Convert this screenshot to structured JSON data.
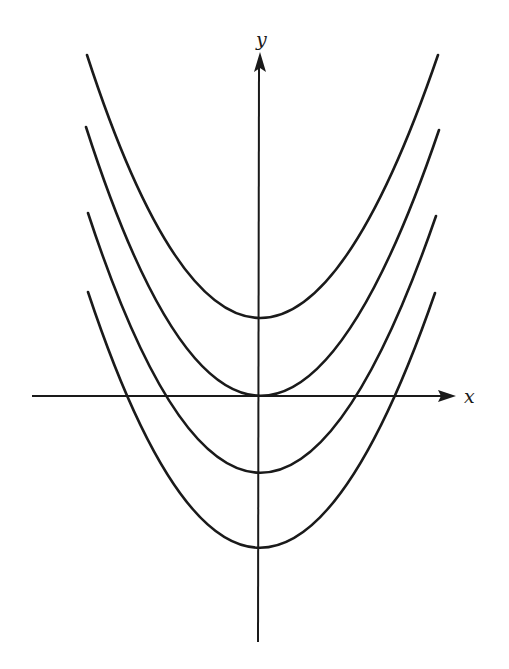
{
  "figure": {
    "axes": {
      "x_label": "x",
      "y_label": "y"
    },
    "curves": [
      {
        "name": "parabola-shift-up",
        "vertex_px": [
          258,
          318
        ],
        "left_end_px": [
          87,
          55
        ],
        "right_end_px": [
          438,
          55
        ]
      },
      {
        "name": "parabola-through-origin",
        "vertex_px": [
          258,
          396
        ],
        "left_end_px": [
          86,
          127
        ],
        "right_end_px": [
          439,
          130
        ]
      },
      {
        "name": "parabola-shift-down-1",
        "vertex_px": [
          258,
          473
        ],
        "left_end_px": [
          88,
          213
        ],
        "right_end_px": [
          436,
          216
        ]
      },
      {
        "name": "parabola-shift-down-2",
        "vertex_px": [
          258,
          548
        ],
        "left_end_px": [
          88,
          292
        ],
        "right_end_px": [
          435,
          293
        ]
      }
    ],
    "colors": {
      "stroke": "#1a1a1a",
      "background": "#ffffff"
    }
  }
}
